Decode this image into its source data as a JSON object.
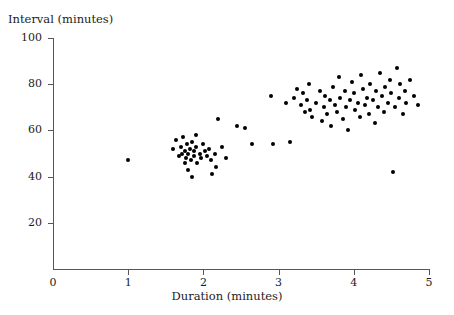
{
  "chart_data": {
    "type": "scatter",
    "title": "",
    "xlabel": "Duration (minutes)",
    "ylabel": "Interval (minutes)",
    "xlim": [
      0,
      5
    ],
    "ylim": [
      0,
      100
    ],
    "xticks": [
      0,
      1,
      2,
      3,
      4,
      5
    ],
    "yticks": [
      20,
      40,
      60,
      80,
      100
    ],
    "xtick_labels": [
      "0",
      "1",
      "2",
      "3",
      "4",
      "5"
    ],
    "ytick_labels": [
      "20",
      "40",
      "60",
      "80",
      "100"
    ],
    "grid": false,
    "legend": null,
    "marker": "filled-circle",
    "marker_color": "#000000",
    "points": [
      [
        1.0,
        47
      ],
      [
        1.6,
        52
      ],
      [
        1.63,
        56
      ],
      [
        1.68,
        49
      ],
      [
        1.7,
        53
      ],
      [
        1.72,
        50
      ],
      [
        1.73,
        57
      ],
      [
        1.75,
        46
      ],
      [
        1.75,
        51
      ],
      [
        1.77,
        48
      ],
      [
        1.78,
        54
      ],
      [
        1.8,
        43
      ],
      [
        1.8,
        50
      ],
      [
        1.82,
        52
      ],
      [
        1.83,
        47
      ],
      [
        1.85,
        40
      ],
      [
        1.85,
        55
      ],
      [
        1.87,
        49
      ],
      [
        1.88,
        51
      ],
      [
        1.9,
        53
      ],
      [
        1.9,
        58
      ],
      [
        1.92,
        46
      ],
      [
        1.95,
        50
      ],
      [
        1.97,
        48
      ],
      [
        2.0,
        54
      ],
      [
        2.02,
        51
      ],
      [
        2.05,
        49
      ],
      [
        2.08,
        52
      ],
      [
        2.1,
        47
      ],
      [
        2.12,
        41
      ],
      [
        2.15,
        50
      ],
      [
        2.17,
        44
      ],
      [
        2.2,
        65
      ],
      [
        2.25,
        53
      ],
      [
        2.3,
        48
      ],
      [
        2.45,
        62
      ],
      [
        2.55,
        61
      ],
      [
        2.65,
        54
      ],
      [
        2.9,
        75
      ],
      [
        2.92,
        54
      ],
      [
        3.1,
        72
      ],
      [
        3.15,
        55
      ],
      [
        3.2,
        74
      ],
      [
        3.25,
        78
      ],
      [
        3.3,
        71
      ],
      [
        3.32,
        76
      ],
      [
        3.35,
        68
      ],
      [
        3.38,
        73
      ],
      [
        3.4,
        80
      ],
      [
        3.42,
        69
      ],
      [
        3.45,
        66
      ],
      [
        3.5,
        72
      ],
      [
        3.55,
        77
      ],
      [
        3.58,
        64
      ],
      [
        3.6,
        70
      ],
      [
        3.62,
        75
      ],
      [
        3.65,
        67
      ],
      [
        3.68,
        73
      ],
      [
        3.7,
        62
      ],
      [
        3.72,
        79
      ],
      [
        3.75,
        71
      ],
      [
        3.78,
        68
      ],
      [
        3.8,
        83
      ],
      [
        3.82,
        74
      ],
      [
        3.85,
        65
      ],
      [
        3.88,
        77
      ],
      [
        3.9,
        70
      ],
      [
        3.92,
        60
      ],
      [
        3.95,
        73
      ],
      [
        3.97,
        81
      ],
      [
        4.0,
        76
      ],
      [
        4.02,
        69
      ],
      [
        4.05,
        72
      ],
      [
        4.08,
        66
      ],
      [
        4.1,
        84
      ],
      [
        4.12,
        78
      ],
      [
        4.15,
        71
      ],
      [
        4.18,
        74
      ],
      [
        4.2,
        67
      ],
      [
        4.22,
        80
      ],
      [
        4.25,
        73
      ],
      [
        4.28,
        63
      ],
      [
        4.3,
        77
      ],
      [
        4.32,
        70
      ],
      [
        4.35,
        85
      ],
      [
        4.38,
        75
      ],
      [
        4.4,
        68
      ],
      [
        4.42,
        79
      ],
      [
        4.45,
        72
      ],
      [
        4.48,
        82
      ],
      [
        4.5,
        76
      ],
      [
        4.52,
        42
      ],
      [
        4.55,
        70
      ],
      [
        4.58,
        87
      ],
      [
        4.6,
        74
      ],
      [
        4.62,
        80
      ],
      [
        4.65,
        67
      ],
      [
        4.68,
        77
      ],
      [
        4.7,
        72
      ],
      [
        4.75,
        82
      ],
      [
        4.8,
        75
      ],
      [
        4.85,
        71
      ]
    ]
  }
}
